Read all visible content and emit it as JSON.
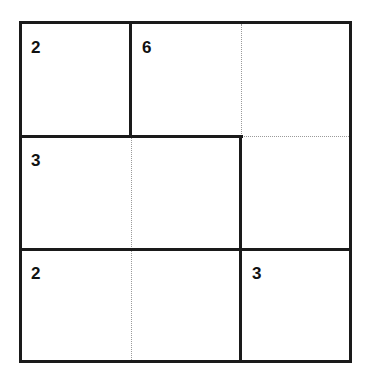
{
  "puzzle": {
    "type": "kenken",
    "size": 3,
    "cages": [
      {
        "clue": "2",
        "cells": [
          [
            0,
            0
          ]
        ]
      },
      {
        "clue": "6",
        "cells": [
          [
            0,
            1
          ],
          [
            0,
            2
          ],
          [
            1,
            2
          ]
        ]
      },
      {
        "clue": "3",
        "cells": [
          [
            1,
            0
          ],
          [
            1,
            1
          ]
        ]
      },
      {
        "clue": "2",
        "cells": [
          [
            2,
            0
          ],
          [
            2,
            1
          ]
        ]
      },
      {
        "clue": "3",
        "cells": [
          [
            2,
            2
          ]
        ]
      }
    ],
    "values": [
      [
        "",
        "",
        ""
      ],
      [
        "",
        "",
        ""
      ],
      [
        "",
        "",
        ""
      ]
    ]
  },
  "colors": {
    "border": "#1a1a1a",
    "inner_line": "#9a9a9a",
    "background": "#ffffff"
  }
}
